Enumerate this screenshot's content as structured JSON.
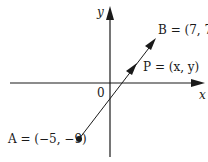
{
  "diagram": {
    "type": "coordinate-plane-vector",
    "axes": {
      "x_label": "x",
      "y_label": "y",
      "origin_label": "0"
    },
    "points": [
      {
        "id": "A",
        "label": "A = (−5, −9)",
        "x": -5,
        "y": -9
      },
      {
        "id": "P",
        "label": "P = (x, y)",
        "x": "x",
        "y": "y"
      },
      {
        "id": "B",
        "label": "B = (7, 7)",
        "x": 7,
        "y": 7
      }
    ],
    "segment": {
      "from": "A",
      "to": "B",
      "arrows": [
        "P",
        "B"
      ]
    },
    "colors": {
      "ink": "#1a1a1a",
      "background": "#ffffff"
    }
  }
}
